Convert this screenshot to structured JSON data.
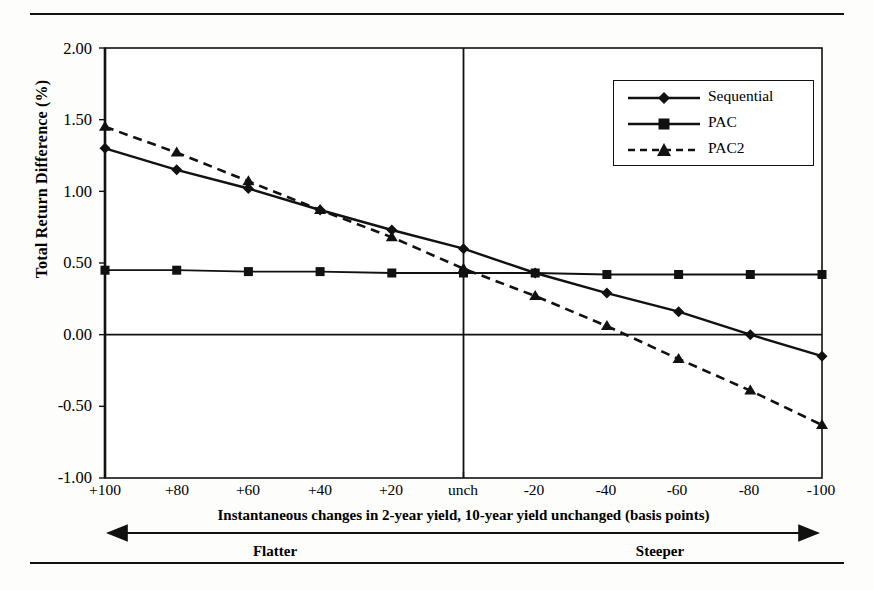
{
  "chart_data": {
    "type": "line",
    "title": "",
    "xlabel": "Instantaneous changes in 2-year yield, 10-year yield unchanged (basis points)",
    "ylabel": "Total Return Difference (%)",
    "categories": [
      "+100",
      "+80",
      "+60",
      "+40",
      "+20",
      "unch",
      "-20",
      "-40",
      "-60",
      "-80",
      "-100"
    ],
    "ylim": [
      -1.0,
      2.0
    ],
    "yticks": [
      "2.00",
      "1.50",
      "1.00",
      "0.50",
      "0.00",
      "-0.50",
      "-1.00"
    ],
    "ytick_values": [
      2.0,
      1.5,
      1.0,
      0.5,
      0.0,
      -0.5,
      -1.0
    ],
    "grid": false,
    "legend_position": "top-right",
    "series": [
      {
        "name": "Sequential",
        "marker": "diamond",
        "line_style": "solid",
        "values": [
          1.3,
          1.15,
          1.02,
          0.87,
          0.73,
          0.6,
          0.43,
          0.29,
          0.16,
          0.0,
          -0.15
        ]
      },
      {
        "name": "PAC",
        "marker": "square",
        "line_style": "solid",
        "values": [
          0.45,
          0.45,
          0.44,
          0.44,
          0.43,
          0.43,
          0.43,
          0.42,
          0.42,
          0.42,
          0.42
        ]
      },
      {
        "name": "PAC2",
        "marker": "triangle",
        "line_style": "dashed",
        "values": [
          1.45,
          1.27,
          1.07,
          0.87,
          0.68,
          0.46,
          0.27,
          0.06,
          -0.17,
          -0.39,
          -0.63
        ]
      }
    ],
    "annotations": {
      "left_direction": "Flatter",
      "right_direction": "Steeper",
      "zero_line": 0.0,
      "unchanged_vertical_line": "unch"
    }
  },
  "axis": {
    "y_title": "Total Return Difference (%)",
    "x_title": "Instantaneous changes in 2-year yield, 10-year yield unchanged (basis points)"
  },
  "legend": {
    "items": [
      {
        "label": "Sequential"
      },
      {
        "label": "PAC"
      },
      {
        "label": "PAC2"
      }
    ]
  },
  "direction_bar": {
    "left": "Flatter",
    "right": "Steeper"
  }
}
